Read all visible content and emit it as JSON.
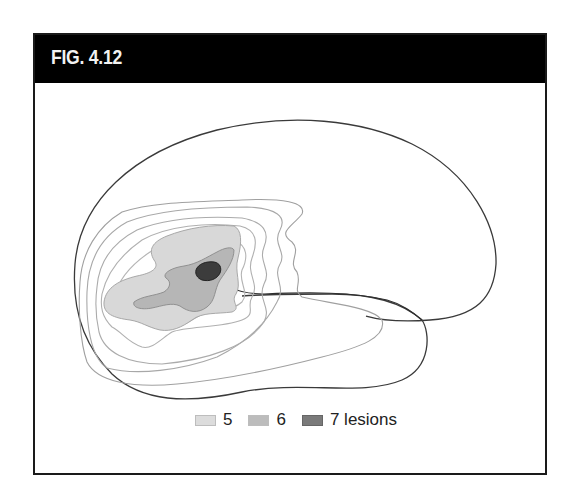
{
  "figure": {
    "label": "FIG. 4.12"
  },
  "diagram": {
    "outline_color": "#3a3a3a",
    "contour_color": "#9a9a9a",
    "fills": {
      "level_5": "#e2e2e2",
      "level_6": "#bdbdbd",
      "level_7": "#3c3c3c"
    }
  },
  "legend": {
    "items": [
      {
        "label": "5",
        "color": "#dcdcdc",
        "name": "legend-5"
      },
      {
        "label": "6",
        "color": "#bcbcbc",
        "name": "legend-6"
      },
      {
        "label": "7 lesions",
        "color": "#7a7a7a",
        "name": "legend-7-lesions"
      }
    ]
  }
}
